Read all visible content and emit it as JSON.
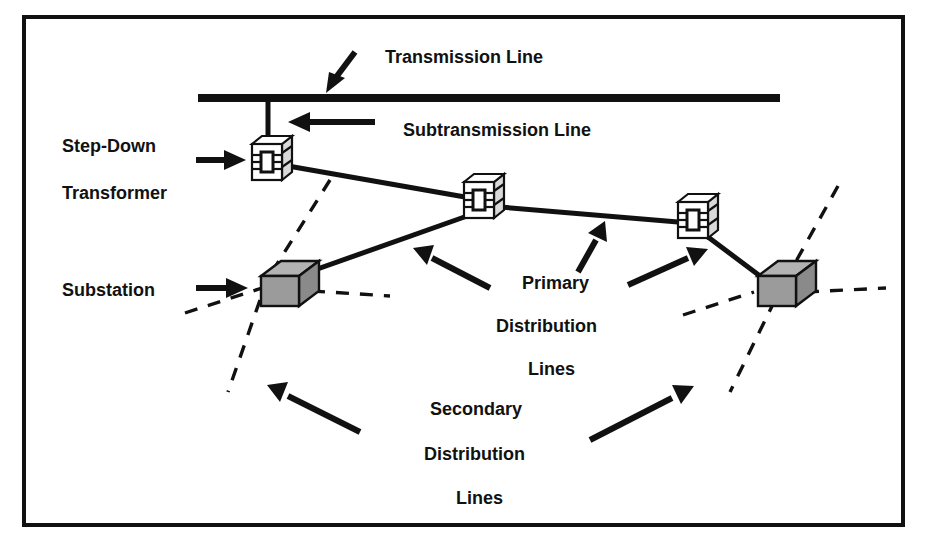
{
  "figure": {
    "background_color": "#ffffff",
    "border_color": "#111111",
    "line_color": "#111111",
    "substation_fill": "#9b9b9b",
    "transformer_fill": "#ffffff"
  },
  "labels": {
    "transmission_line": "Transmission Line",
    "subtransmission_line": "Subtransmission Line",
    "step_down": "Step-Down",
    "transformer": "Transformer",
    "substation": "Substation",
    "primary": "Primary",
    "primary_distribution": "Distribution",
    "primary_lines": "Lines",
    "secondary": "Secondary",
    "secondary_distribution": "Distribution",
    "secondary_lines": "Lines"
  },
  "icons": {
    "transformer_icon": "step-down-transformer-cube",
    "substation_icon": "substation-cube",
    "arrow_icon": "pointer-arrow"
  },
  "elements": {
    "transmission_bar": "horizontal heavy bar",
    "transformer_count": 3,
    "substation_count": 2,
    "arrow_count": 7
  }
}
